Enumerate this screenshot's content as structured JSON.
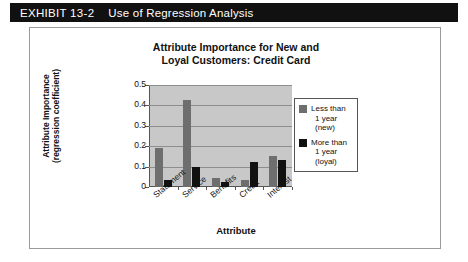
{
  "exhibit": {
    "label": "EXHIBIT 13-2",
    "title": "Use of Regression Analysis"
  },
  "chart_data": {
    "type": "bar",
    "title_line1": "Attribute Importance for New and",
    "title_line2": "Loyal Customers: Credit Card",
    "title": "Attribute Importance for New and Loyal Customers: Credit Card",
    "xlabel": "Attribute",
    "ylabel_line1": "Attribute Importance",
    "ylabel_line2": "(regression coefficient)",
    "ylabel": "Attribute Importance (regression coefficient)",
    "categories": [
      "Statement",
      "Service",
      "Benefits",
      "Credit",
      "Interest"
    ],
    "series": [
      {
        "name": "Less than 1 year (new)",
        "name_line1": "Less than",
        "name_line2": "1 year (new)",
        "color": "#6e6e6e",
        "values": [
          0.19,
          0.425,
          0.045,
          0.035,
          0.15
        ]
      },
      {
        "name": "More than 1 year (loyal)",
        "name_line1": "More than",
        "name_line2": "1 year (loyal)",
        "color": "#111111",
        "values": [
          0.035,
          0.1,
          0.025,
          0.125,
          0.13
        ]
      }
    ],
    "ylim": [
      0,
      0.5
    ],
    "yticks": [
      "0",
      "0.1",
      "0.2",
      "0.3",
      "0.4",
      "0.5"
    ],
    "ytick_values": [
      0,
      0.1,
      0.2,
      0.3,
      0.4,
      0.5
    ],
    "grid": true,
    "legend_position": "right",
    "plot_background": "#c8c8c8"
  }
}
